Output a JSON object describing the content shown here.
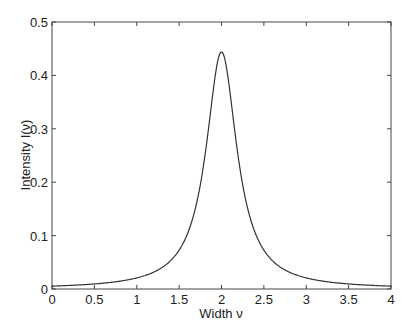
{
  "chart_data": {
    "type": "line",
    "title": "",
    "xlabel": "Width ν",
    "ylabel": "Intensity I(ν)",
    "xlim": [
      0,
      4
    ],
    "ylim": [
      0,
      0.5
    ],
    "xticks": [
      "0",
      "0.5",
      "1",
      "1.5",
      "2",
      "2.5",
      "3",
      "3.5",
      "4"
    ],
    "yticks": [
      "0",
      "0.1",
      "0.2",
      "0.3",
      "0.4",
      "0.5"
    ],
    "grid": false,
    "legend": null,
    "series": [
      {
        "name": "I(ν)",
        "x": [
          0,
          0.25,
          0.5,
          0.75,
          1.0,
          1.25,
          1.5,
          1.6,
          1.7,
          1.8,
          1.9,
          1.95,
          2.0,
          2.05,
          2.1,
          2.2,
          2.3,
          2.4,
          2.5,
          2.75,
          3.0,
          3.25,
          3.5,
          3.75,
          4.0
        ],
        "y": [
          0.0054,
          0.007,
          0.0095,
          0.0137,
          0.0207,
          0.0356,
          0.073,
          0.104,
          0.157,
          0.244,
          0.369,
          0.425,
          0.444,
          0.425,
          0.369,
          0.244,
          0.157,
          0.104,
          0.073,
          0.0356,
          0.0207,
          0.0137,
          0.0095,
          0.007,
          0.0054
        ]
      }
    ]
  }
}
